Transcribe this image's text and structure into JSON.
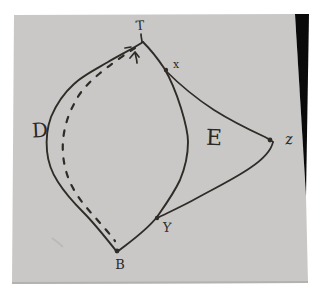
{
  "scene": {
    "labels": {
      "t": "T",
      "x": "x",
      "d": "D",
      "e": "E",
      "z": "z",
      "y": "Y",
      "b": "B"
    },
    "colors": {
      "background": "#ffffff",
      "paper": "#c9c8c6",
      "paper_edge": "#b3b2af",
      "ink": "#2f2b27",
      "corner_shadow": "#0a0a0a"
    }
  }
}
